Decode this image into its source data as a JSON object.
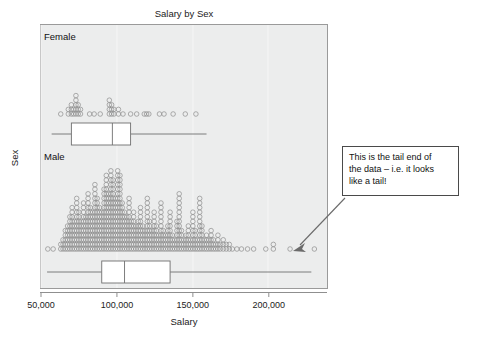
{
  "chart_data": {
    "type": "scatter",
    "title": "Salary by Sex",
    "xlabel": "Salary",
    "ylabel": "Sex",
    "grid": true,
    "legend": "none",
    "xlim": [
      50000,
      237000
    ],
    "xticks": [
      50000,
      100000,
      150000,
      200000
    ],
    "xticklabels": [
      "50,000",
      "100,000",
      "150,000",
      "200,000"
    ],
    "panels": [
      {
        "label": "Female",
        "boxplot": {
          "whisker_low": 57000,
          "q1": 70000,
          "median": 97000,
          "q3": 109000,
          "whisker_high": 159000
        },
        "dotplot_note": "stacked dot histogram of female salaries, sparse, spanning ~63,000 to ~160,000",
        "dotplot_bins": [
          {
            "x": 63000,
            "count": 1
          },
          {
            "x": 68000,
            "count": 2
          },
          {
            "x": 70000,
            "count": 3
          },
          {
            "x": 71500,
            "count": 2
          },
          {
            "x": 73000,
            "count": 5
          },
          {
            "x": 74500,
            "count": 3
          },
          {
            "x": 76000,
            "count": 2
          },
          {
            "x": 82000,
            "count": 1
          },
          {
            "x": 85000,
            "count": 1
          },
          {
            "x": 89000,
            "count": 1
          },
          {
            "x": 95000,
            "count": 4
          },
          {
            "x": 96500,
            "count": 3
          },
          {
            "x": 98000,
            "count": 2
          },
          {
            "x": 101000,
            "count": 2
          },
          {
            "x": 104000,
            "count": 1
          },
          {
            "x": 109000,
            "count": 1
          },
          {
            "x": 113000,
            "count": 1
          },
          {
            "x": 118000,
            "count": 1
          },
          {
            "x": 119500,
            "count": 1
          },
          {
            "x": 121000,
            "count": 1
          },
          {
            "x": 128000,
            "count": 1
          },
          {
            "x": 131000,
            "count": 1
          },
          {
            "x": 137000,
            "count": 1
          },
          {
            "x": 145000,
            "count": 1
          },
          {
            "x": 152000,
            "count": 1
          }
        ]
      },
      {
        "label": "Male",
        "boxplot": {
          "whisker_low": 54000,
          "q1": 90000,
          "median": 105000,
          "q3": 135000,
          "whisker_high": 228000
        },
        "dotplot_note": "dense stacked dot histogram of male salaries peaking near 95,000-105,000 with long right tail to ~230,000",
        "dotplot_bins": [
          {
            "x": 54500,
            "count": 1
          },
          {
            "x": 58000,
            "count": 1
          },
          {
            "x": 63000,
            "count": 2
          },
          {
            "x": 64500,
            "count": 3
          },
          {
            "x": 66000,
            "count": 5
          },
          {
            "x": 67500,
            "count": 6
          },
          {
            "x": 69000,
            "count": 8
          },
          {
            "x": 70500,
            "count": 10
          },
          {
            "x": 72000,
            "count": 7
          },
          {
            "x": 73500,
            "count": 12
          },
          {
            "x": 75000,
            "count": 9
          },
          {
            "x": 76500,
            "count": 7
          },
          {
            "x": 78000,
            "count": 11
          },
          {
            "x": 79500,
            "count": 8
          },
          {
            "x": 81000,
            "count": 13
          },
          {
            "x": 82500,
            "count": 10
          },
          {
            "x": 84000,
            "count": 9
          },
          {
            "x": 85500,
            "count": 15
          },
          {
            "x": 87000,
            "count": 12
          },
          {
            "x": 88500,
            "count": 10
          },
          {
            "x": 90000,
            "count": 9
          },
          {
            "x": 91500,
            "count": 14
          },
          {
            "x": 93000,
            "count": 17
          },
          {
            "x": 94500,
            "count": 13
          },
          {
            "x": 96000,
            "count": 18
          },
          {
            "x": 97500,
            "count": 16
          },
          {
            "x": 99000,
            "count": 12
          },
          {
            "x": 100500,
            "count": 18
          },
          {
            "x": 102000,
            "count": 17
          },
          {
            "x": 103500,
            "count": 11
          },
          {
            "x": 105000,
            "count": 9
          },
          {
            "x": 106500,
            "count": 8
          },
          {
            "x": 108000,
            "count": 12
          },
          {
            "x": 109500,
            "count": 7
          },
          {
            "x": 111000,
            "count": 9
          },
          {
            "x": 112500,
            "count": 6
          },
          {
            "x": 114000,
            "count": 7
          },
          {
            "x": 115500,
            "count": 10
          },
          {
            "x": 117000,
            "count": 6
          },
          {
            "x": 118500,
            "count": 5
          },
          {
            "x": 120000,
            "count": 12
          },
          {
            "x": 121500,
            "count": 7
          },
          {
            "x": 123000,
            "count": 5
          },
          {
            "x": 124500,
            "count": 9
          },
          {
            "x": 126000,
            "count": 6
          },
          {
            "x": 127500,
            "count": 4
          },
          {
            "x": 129000,
            "count": 11
          },
          {
            "x": 130500,
            "count": 5
          },
          {
            "x": 132000,
            "count": 4
          },
          {
            "x": 133500,
            "count": 6
          },
          {
            "x": 135000,
            "count": 9
          },
          {
            "x": 136500,
            "count": 4
          },
          {
            "x": 138000,
            "count": 3
          },
          {
            "x": 139500,
            "count": 7
          },
          {
            "x": 141000,
            "count": 13
          },
          {
            "x": 142500,
            "count": 5
          },
          {
            "x": 144000,
            "count": 3
          },
          {
            "x": 145500,
            "count": 4
          },
          {
            "x": 147000,
            "count": 6
          },
          {
            "x": 148500,
            "count": 3
          },
          {
            "x": 150000,
            "count": 9
          },
          {
            "x": 151500,
            "count": 5
          },
          {
            "x": 153000,
            "count": 3
          },
          {
            "x": 154500,
            "count": 12
          },
          {
            "x": 156000,
            "count": 6
          },
          {
            "x": 157500,
            "count": 3
          },
          {
            "x": 159000,
            "count": 4
          },
          {
            "x": 160500,
            "count": 3
          },
          {
            "x": 162000,
            "count": 5
          },
          {
            "x": 163500,
            "count": 3
          },
          {
            "x": 165000,
            "count": 2
          },
          {
            "x": 166500,
            "count": 4
          },
          {
            "x": 168000,
            "count": 2
          },
          {
            "x": 170000,
            "count": 3
          },
          {
            "x": 172000,
            "count": 2
          },
          {
            "x": 174000,
            "count": 2
          },
          {
            "x": 176000,
            "count": 1
          },
          {
            "x": 179000,
            "count": 1
          },
          {
            "x": 182000,
            "count": 1
          },
          {
            "x": 186000,
            "count": 1
          },
          {
            "x": 190000,
            "count": 1
          },
          {
            "x": 198000,
            "count": 1
          },
          {
            "x": 203000,
            "count": 2
          },
          {
            "x": 214000,
            "count": 1
          },
          {
            "x": 230000,
            "count": 1
          }
        ]
      }
    ]
  },
  "annotation": {
    "line1": "This is the tail end of",
    "line2": "the data – i.e. it looks",
    "line3": "like a tail!"
  },
  "colors": {
    "plot_background": "#eceded",
    "dot_stroke": "#8d8d8d",
    "box_stroke": "#6f6f6f",
    "frame": "#9a9a9a",
    "text": "#1a1a1a"
  }
}
